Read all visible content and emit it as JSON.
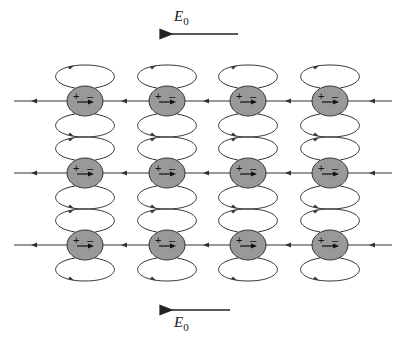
{
  "diagram": {
    "field_label_top": {
      "symbol": "E",
      "subscript": "0"
    },
    "field_label_bottom": {
      "symbol": "E",
      "subscript": "0"
    },
    "rows_y": [
      101,
      173,
      245
    ],
    "cols_x": [
      85,
      167,
      248,
      330
    ],
    "dipole": {
      "plus": "+",
      "minus": "–",
      "fill": "#999999",
      "stroke": "#333333"
    },
    "line_color": "#333333",
    "field_direction": "left"
  }
}
